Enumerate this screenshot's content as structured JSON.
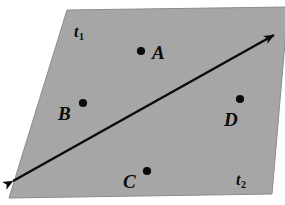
{
  "figure": {
    "type": "geometric-diagram",
    "canvas": {
      "width": 285,
      "height": 205,
      "background_color": "#ffffff"
    },
    "plane": {
      "name": "shaded-plane",
      "fill_color": "#a6a6a6",
      "stroke_color": "#8c8c8c",
      "corners": [
        {
          "x": 67,
          "y": 10
        },
        {
          "x": 288,
          "y": 7
        },
        {
          "x": 272,
          "y": 194
        },
        {
          "x": 9,
          "y": 198
        }
      ]
    },
    "region_labels": [
      {
        "id": "t1",
        "base": "t",
        "sub": "1",
        "x": 74,
        "y": 24
      },
      {
        "id": "t2",
        "base": "t",
        "sub": "2",
        "x": 236,
        "y": 172
      }
    ],
    "points": [
      {
        "id": "A",
        "label": "A",
        "dot_x": 141,
        "dot_y": 51,
        "label_x": 152,
        "label_y": 43,
        "dot_radius": 4.1
      },
      {
        "id": "B",
        "label": "B",
        "dot_x": 83,
        "dot_y": 103,
        "label_x": 58,
        "label_y": 104,
        "dot_radius": 4.1
      },
      {
        "id": "C",
        "label": "C",
        "dot_x": 147,
        "dot_y": 171,
        "label_x": 123,
        "label_y": 172,
        "dot_radius": 4.1
      },
      {
        "id": "D",
        "label": "D",
        "dot_x": 240,
        "dot_y": 99,
        "label_x": 224,
        "label_y": 110,
        "dot_radius": 4.1
      }
    ],
    "arrow": {
      "name": "double-headed-line",
      "color": "#0a0a0a",
      "stroke_width": 2.4,
      "start": {
        "x": 13,
        "y": 181
      },
      "end": {
        "x": 274,
        "y": 35
      },
      "double_headed": true,
      "head_length": 19,
      "head_width": 9
    }
  }
}
